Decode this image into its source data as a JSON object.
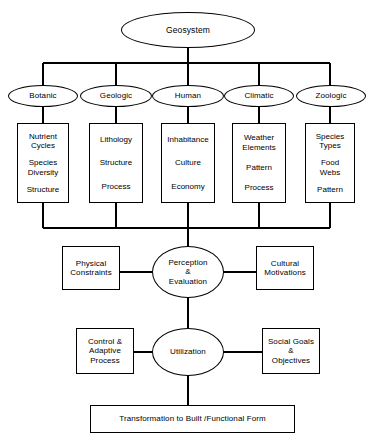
{
  "diagram": {
    "title": "Geosystem",
    "root": {
      "label": "Geosystem"
    },
    "subsystems": [
      {
        "label": "Botanic",
        "items": [
          "Nutrient\nCycles",
          "Species\nDiversity",
          "Structure"
        ]
      },
      {
        "label": "Geologic",
        "items": [
          "Lithology",
          "Structure",
          "Process"
        ]
      },
      {
        "label": "Human",
        "items": [
          "Inhabitance",
          "Culture",
          "Economy"
        ]
      },
      {
        "label": "Climatic",
        "items": [
          "Weather\nElements",
          "Pattern",
          "Process"
        ]
      },
      {
        "label": "Zoologic",
        "items": [
          "Species\nTypes",
          "Food\nWebs",
          "Pattern"
        ]
      }
    ],
    "perception": {
      "left": "Physical\nConstraints",
      "center": "Perception\n&\nEvaluation",
      "right": "Cultural\nMotivations"
    },
    "utilization": {
      "left": "Control &\nAdaptive\nProcess",
      "center": "Utilization",
      "right": "Social Goals\n&\nObjectives"
    },
    "output": {
      "label": "Transformation to Built /Functional Form"
    },
    "colors": {
      "stroke": "#000000",
      "fill": "#ffffff",
      "text": "#000000"
    }
  }
}
